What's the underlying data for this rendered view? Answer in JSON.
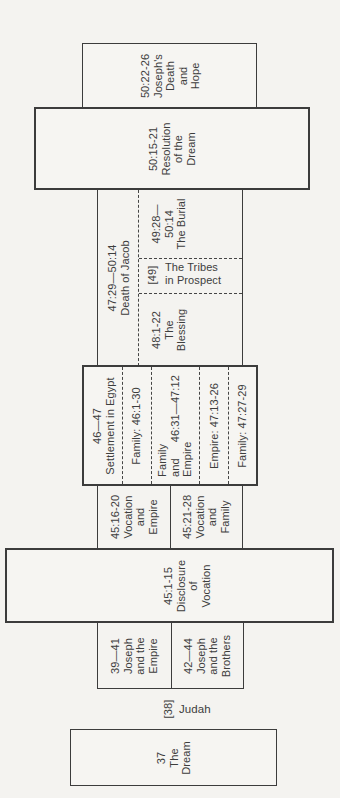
{
  "palette": {
    "background": "#f4f3f0",
    "line": "#3c3c3c",
    "text": "#3d3d3d"
  },
  "sections": {
    "josephs_death": {
      "lines": [
        "50:22-26",
        "Joseph's",
        "Death",
        "and",
        "Hope"
      ]
    },
    "resolution": {
      "lines": [
        "50:15-21",
        "Resolution",
        "of the",
        "Dream"
      ]
    },
    "death_of_jacob": {
      "header": {
        "lines": [
          "47:29—50:14",
          "Death of Jacob"
        ]
      },
      "burial": {
        "lines": [
          "49:28—",
          "50:14",
          "The Burial"
        ]
      },
      "tribes": {
        "ref": "[49]",
        "lines": [
          "The Tribes",
          "in Prospect"
        ]
      },
      "blessing": {
        "lines": [
          "48:1-22",
          "The",
          "Blessing"
        ]
      }
    },
    "settlement": {
      "header": {
        "lines": [
          "46—47",
          "Settlement in Egypt"
        ]
      },
      "family_row": {
        "label": "Family: 46:1-30"
      },
      "family_empire_row": {
        "line1": "Family",
        "line2_word": "and",
        "line2_ref": "46:31—47:12",
        "line3": "Empire"
      },
      "empire_row": {
        "label": "Empire: 47:13-26"
      },
      "family2_row": {
        "label": "Family: 47:27-29"
      }
    },
    "vocation_empire": {
      "lines": [
        "45:16-20",
        "Vocation",
        "and",
        "Empire"
      ]
    },
    "vocation_family": {
      "lines": [
        "45:21-28",
        "Vocation",
        "and",
        "Family"
      ]
    },
    "disclosure": {
      "lines": [
        "45:1-15",
        "Disclosure",
        "of",
        "Vocation"
      ]
    },
    "joseph_empire": {
      "lines": [
        "39—41",
        "Joseph",
        "and the",
        "Empire"
      ]
    },
    "joseph_brothers": {
      "lines": [
        "42—44",
        "Joseph",
        "and the",
        "Brothers"
      ]
    },
    "judah": {
      "ref": "[38]",
      "label": "Judah"
    },
    "dream": {
      "lines": [
        "37",
        "The",
        "Dream"
      ]
    }
  }
}
